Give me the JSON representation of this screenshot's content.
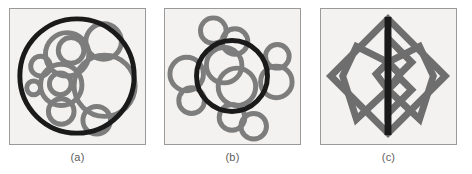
{
  "figure": {
    "background_color": "#ffffff",
    "panel_count": 3,
    "panel_fill_color": "#f3f2f0",
    "panel_border_color": "#9a9a9a",
    "stroke_dark_color": "#1a1a1a",
    "stroke_gray_color": "#7d7d7d",
    "caption_color": "#5d5d5d"
  },
  "panels": [
    {
      "id": "a",
      "caption": "(a)",
      "name": "circles-nested-in-outer-circle",
      "shape_kind": "circle-packing",
      "outer": {
        "type": "circle",
        "cx": 68,
        "cy": 68,
        "r": 58,
        "stroke": "#1a1a1a",
        "stroke_width": 5
      },
      "inner_circles": [
        {
          "cx": 95,
          "cy": 33,
          "r": 18
        },
        {
          "cx": 96,
          "cy": 78,
          "r": 31
        },
        {
          "cx": 58,
          "cy": 46,
          "r": 22
        },
        {
          "cx": 62,
          "cy": 42,
          "r": 13
        },
        {
          "cx": 31,
          "cy": 58,
          "r": 10
        },
        {
          "cx": 52,
          "cy": 77,
          "r": 21
        },
        {
          "cx": 51,
          "cy": 76,
          "r": 11
        },
        {
          "cx": 52,
          "cy": 104,
          "r": 13
        },
        {
          "cx": 88,
          "cy": 113,
          "r": 14
        },
        {
          "cx": 24,
          "cy": 80,
          "r": 7
        }
      ],
      "inner_stroke": "#7d7d7d",
      "inner_stroke_width": 5
    },
    {
      "id": "b",
      "caption": "(b)",
      "name": "circles-clustered-around-outer-circle",
      "shape_kind": "circle-cluster",
      "outer": {
        "type": "circle",
        "cx": 68,
        "cy": 68,
        "r": 36,
        "stroke": "#1a1a1a",
        "stroke_width": 5
      },
      "inner_circles": [
        {
          "cx": 60,
          "cy": 57,
          "r": 18
        },
        {
          "cx": 73,
          "cy": 79,
          "r": 19
        }
      ],
      "satellite_circles": [
        {
          "cx": 49,
          "cy": 22,
          "r": 13
        },
        {
          "cx": 71,
          "cy": 33,
          "r": 13
        },
        {
          "cx": 22,
          "cy": 66,
          "r": 17
        },
        {
          "cx": 27,
          "cy": 93,
          "r": 13
        },
        {
          "cx": 114,
          "cy": 48,
          "r": 12
        },
        {
          "cx": 113,
          "cy": 74,
          "r": 16
        },
        {
          "cx": 68,
          "cy": 110,
          "r": 13
        },
        {
          "cx": 90,
          "cy": 119,
          "r": 13
        }
      ],
      "inner_stroke": "#7d7d7d",
      "inner_stroke_width": 5
    },
    {
      "id": "c",
      "caption": "(c)",
      "name": "diamond-with-vertical-axis",
      "shape_kind": "polygon-diamond",
      "outer": {
        "type": "diamond",
        "points": "68,10 126,68 68,126 10,68",
        "stroke": "#6e6e6e",
        "stroke_width": 7
      },
      "axis_line": {
        "x1": 68,
        "y1": 8,
        "x2": 68,
        "y2": 128,
        "stroke": "#1a1a1a",
        "stroke_width": 7
      },
      "inner_shapes": [
        {
          "name": "upper-chevron",
          "points": "68,30 92,54 80,66 68,54"
        },
        {
          "name": "lower-chevron",
          "points": "68,106 92,82 80,70 68,82"
        },
        {
          "name": "left-diamond",
          "points": "68,54 56,66 68,82 36,112 22,68 36,38"
        },
        {
          "name": "right-diamond",
          "points": "68,54 80,66 68,82 100,112 114,68 100,38"
        }
      ],
      "inner_stroke": "#6e6e6e",
      "inner_stroke_width": 7
    }
  ]
}
